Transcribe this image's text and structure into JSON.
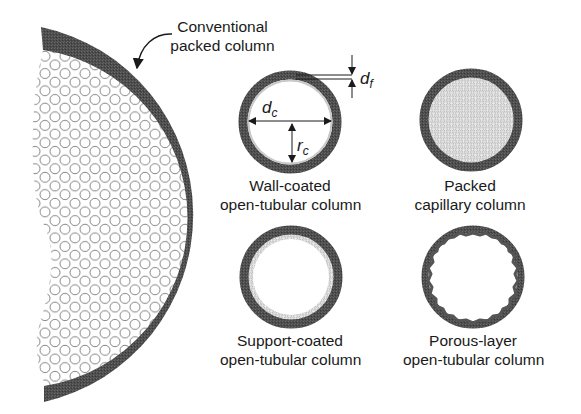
{
  "diagram": {
    "colors": {
      "wall": "#4a4a4a",
      "packing_stroke": "#7a7a7a",
      "text": "#1a1a1a",
      "background": "#ffffff"
    },
    "callout": {
      "line1": "Conventional",
      "line2": "packed column"
    },
    "columns": [
      {
        "id": "wall-coated",
        "line1": "Wall-coated",
        "line2": "open-tubular column",
        "symbols": {
          "diameter": "d",
          "diameter_sub": "c",
          "radius": "r",
          "radius_sub": "c",
          "film": "d",
          "film_sub": "f"
        }
      },
      {
        "id": "packed-capillary",
        "line1": "Packed",
        "line2": "capillary column"
      },
      {
        "id": "support-coated",
        "line1": "Support-coated",
        "line2": "open-tubular column"
      },
      {
        "id": "porous-layer",
        "line1": "Porous-layer",
        "line2": "open-tubular column"
      }
    ]
  }
}
